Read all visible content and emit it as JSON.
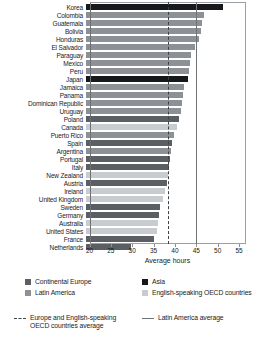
{
  "chart_data": {
    "type": "bar",
    "orientation": "horizontal",
    "title": "",
    "xlabel": "Average hours",
    "ylabel": "",
    "xlim": [
      20,
      56.5
    ],
    "xticks": [
      20,
      25,
      30,
      35,
      40,
      45,
      50,
      55
    ],
    "grid": false,
    "legend_position": "below",
    "categories": [
      "Korea",
      "Colombia",
      "Guatemala",
      "Bolivia",
      "Honduras",
      "El Salvador",
      "Paraguay",
      "Mexico",
      "Peru",
      "Japan",
      "Jamaica",
      "Panama",
      "Dominican Republic",
      "Uruguay",
      "Poland",
      "Canada",
      "Puerto Rico",
      "Spain",
      "Argentina",
      "Portugal",
      "Italy",
      "New Zealand",
      "Austria",
      "Ireland",
      "United Kingdom",
      "Sweden",
      "Germany",
      "Australia",
      "United States",
      "France",
      "Netherlands"
    ],
    "values": [
      52.0,
      47.6,
      47.2,
      46.9,
      46.4,
      45.6,
      44.6,
      44.3,
      44.1,
      43.8,
      43.0,
      42.6,
      42.4,
      42.2,
      41.8,
      41.4,
      40.6,
      40.2,
      39.8,
      39.6,
      39.4,
      39.2,
      39.0,
      38.4,
      38.0,
      37.4,
      37.0,
      36.8,
      36.6,
      35.8,
      30.6
    ],
    "groups": [
      "asia",
      "latin",
      "latin",
      "latin",
      "latin",
      "latin",
      "latin",
      "latin",
      "latin",
      "asia",
      "latin",
      "latin",
      "latin",
      "latin",
      "continental",
      "english",
      "latin",
      "continental",
      "latin",
      "continental",
      "continental",
      "english",
      "continental",
      "english",
      "english",
      "continental",
      "continental",
      "english",
      "english",
      "continental",
      "continental"
    ],
    "reference_lines": [
      {
        "id": "oecd-average",
        "value": 38.4,
        "style": "dashed",
        "label": "Europe and English-speaking OECD countries average"
      },
      {
        "id": "latin-average",
        "value": 45.0,
        "style": "solid",
        "label": "Latin America average"
      }
    ],
    "series_colors": {
      "asia": "#16181a",
      "continental": "#5b5f63",
      "latin": "#8d9195",
      "english": "#c9ccce"
    },
    "legend": [
      {
        "key": "continental",
        "label": "Continental Europe",
        "swatch": "#5b5f63"
      },
      {
        "key": "latin",
        "label": "Latin America",
        "swatch": "#8d9195"
      },
      {
        "key": "asia",
        "label": "Asia",
        "swatch": "#16181a"
      },
      {
        "key": "english",
        "label": "English-speaking OECD countries",
        "swatch": "#c9ccce"
      }
    ]
  }
}
